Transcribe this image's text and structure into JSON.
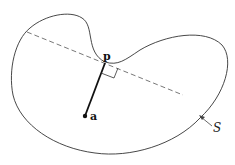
{
  "figure": {
    "labels": {
      "p": "p",
      "a": "a",
      "S": "S"
    },
    "elements": {
      "curve": "closed-curve-S",
      "tangent_line": "dashed-tangent-line-at-p",
      "segment": "segment-a-to-p",
      "right_angle": "right-angle-marker",
      "point_a": "point-a",
      "arrow_S": "arrow-pointing-to-curve"
    },
    "colors": {
      "stroke": "#333333",
      "dashed": "#555555",
      "text": "#111111"
    }
  }
}
